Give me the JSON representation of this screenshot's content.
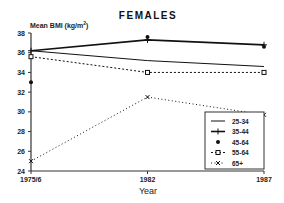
{
  "chart_data": {
    "type": "line",
    "title": "FEMALES",
    "xlabel": "Year",
    "ylabel": "Mean BMI (kg/m²)",
    "ylabel_main": "Mean BMI (kg/m",
    "ylabel_sup": "2",
    "ylabel_end": ")",
    "categories": [
      "1975/6",
      "1982",
      "1987"
    ],
    "ylim": [
      24,
      38
    ],
    "yticks": [
      24,
      26,
      28,
      30,
      32,
      34,
      36,
      38
    ],
    "grid": false,
    "legend_position": "bottom-right",
    "series": [
      {
        "name": "25-34",
        "values": [
          36.2,
          35.2,
          34.6
        ],
        "style": "solid-thin",
        "marker": "none"
      },
      {
        "name": "35-44",
        "values": [
          36.2,
          37.3,
          36.8
        ],
        "style": "solid",
        "marker": "plus"
      },
      {
        "name": "45-64",
        "values": [
          33.0,
          37.6,
          36.6
        ],
        "style": "none",
        "marker": "star"
      },
      {
        "name": "55-64",
        "values": [
          35.6,
          34.0,
          34.0
        ],
        "style": "dashed",
        "marker": "square"
      },
      {
        "name": "65+",
        "values": [
          25.0,
          31.5,
          29.7
        ],
        "style": "dotted",
        "marker": "x"
      }
    ]
  }
}
